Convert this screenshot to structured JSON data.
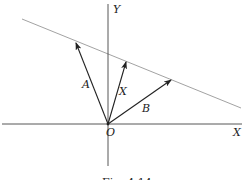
{
  "diagram": {
    "axes": {
      "x_label": "X",
      "y_label": "Y",
      "origin_label": "O"
    },
    "vectors": [
      {
        "name": "A",
        "label": "A"
      },
      {
        "name": "X",
        "label": "X"
      },
      {
        "name": "B",
        "label": "B"
      }
    ],
    "caption": "Fig. 4.14",
    "colors": {
      "axis": "#333333",
      "vector": "#222222",
      "line": "#888888"
    }
  }
}
